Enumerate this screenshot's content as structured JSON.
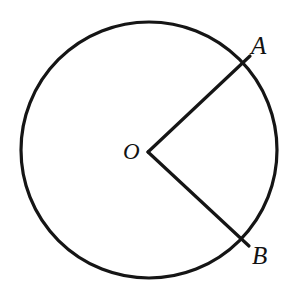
{
  "figure": {
    "kind": "geometry-diagram",
    "background_color": "#ffffff",
    "stroke_color": "#151515",
    "label_color": "#121212",
    "canvas": {
      "width": 294,
      "height": 304
    },
    "circle": {
      "name": "main-circle",
      "center_x": 149,
      "center_y": 150,
      "radius": 128,
      "stroke_width": 3.2
    },
    "center_point": {
      "name": "point-O",
      "label": "O",
      "x": 148,
      "y": 152,
      "label_x": 130,
      "label_y": 152
    },
    "points": [
      {
        "name": "point-A",
        "label": "A",
        "x": 248,
        "y": 58,
        "label_x": 261,
        "label_y": 45,
        "angle_deg": 43
      },
      {
        "name": "point-B",
        "label": "B",
        "x": 247,
        "y": 244,
        "label_x": 261,
        "label_y": 255,
        "angle_deg": -43
      }
    ],
    "radii": [
      {
        "name": "radius-OA",
        "from": "O",
        "to": "A",
        "x1": 148,
        "y1": 152,
        "x2": 250,
        "y2": 56,
        "stroke_width": 3.2
      },
      {
        "name": "radius-OB",
        "from": "O",
        "to": "B",
        "x1": 148,
        "y1": 152,
        "x2": 249,
        "y2": 246,
        "stroke_width": 3.2
      }
    ]
  }
}
